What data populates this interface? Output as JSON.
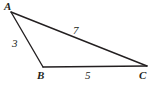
{
  "diagram": {
    "type": "triangle",
    "stroke_color": "#231f20",
    "background_color": "#ffffff",
    "vertices": [
      {
        "name": "A",
        "label": "A",
        "x": 11,
        "y": 12
      },
      {
        "name": "B",
        "label": "B",
        "x": 43,
        "y": 67
      },
      {
        "name": "C",
        "label": "C",
        "x": 147,
        "y": 66
      }
    ],
    "sides": [
      {
        "name": "AB",
        "label": "3",
        "from": "A",
        "to": "B"
      },
      {
        "name": "AC",
        "label": "7",
        "from": "A",
        "to": "C"
      },
      {
        "name": "BC",
        "label": "5",
        "from": "B",
        "to": "C"
      }
    ]
  }
}
